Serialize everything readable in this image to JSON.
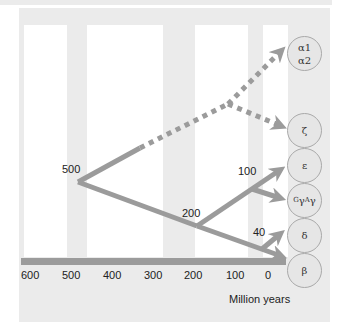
{
  "colors": {
    "panel": "#ebebeb",
    "strip": "#ffffff",
    "arrow": "#9b9b9b",
    "circle_fill": "#e6e6e6",
    "circle_stroke": "#a9a9a9"
  },
  "axis": {
    "ticks": [
      "600",
      "500",
      "400",
      "300",
      "200",
      "100",
      "0"
    ],
    "unit_label": "Million years"
  },
  "node_labels": {
    "n500": "500",
    "n200": "200",
    "n100": "100",
    "n40": "40"
  },
  "genes": {
    "alpha1": "α1",
    "alpha2": "α2",
    "zeta": "ζ",
    "epsilon": "ε",
    "gamma_g_sup": "G",
    "gamma_a_sup": "A",
    "gamma_sym": "γ",
    "delta": "δ",
    "beta": "β"
  }
}
